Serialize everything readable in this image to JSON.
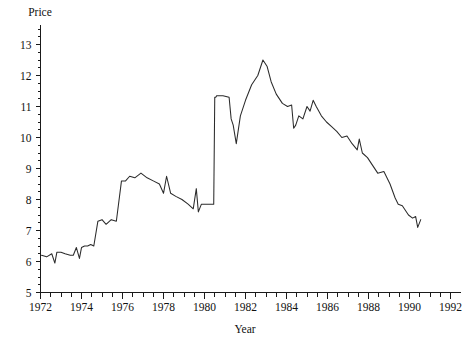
{
  "chart_data": {
    "type": "line",
    "title": "",
    "ylabel": "Price",
    "xlabel": "Year",
    "xlim": [
      1972,
      1992
    ],
    "ylim": [
      5,
      13
    ],
    "grid": false,
    "legend": "none",
    "x_tick_labels": [
      "1972",
      "1974",
      "1976",
      "1978",
      "1980",
      "1982",
      "1984",
      "1986",
      "1988",
      "1990",
      "1992"
    ],
    "x_tick_values": [
      1972,
      1974,
      1976,
      1978,
      1980,
      1982,
      1984,
      1986,
      1988,
      1990,
      1992
    ],
    "x_minor_step": 0.5,
    "y_tick_labels": [
      "5",
      "6",
      "7",
      "8",
      "9",
      "10",
      "11",
      "12",
      "13"
    ],
    "y_tick_values": [
      5,
      6,
      7,
      8,
      9,
      10,
      11,
      12,
      13
    ],
    "y_minor_step": 0.25,
    "line_color": "#2b2b2b",
    "axis_color": "#1a1a1a",
    "series": [
      {
        "name": "Price",
        "x": [
          1972.05,
          1972.3,
          1972.55,
          1972.7,
          1972.8,
          1973.0,
          1973.2,
          1973.45,
          1973.6,
          1973.75,
          1973.9,
          1974.0,
          1974.15,
          1974.3,
          1974.45,
          1974.6,
          1974.8,
          1975.0,
          1975.2,
          1975.45,
          1975.7,
          1975.95,
          1976.15,
          1976.35,
          1976.6,
          1976.9,
          1977.2,
          1977.5,
          1977.8,
          1978.0,
          1978.15,
          1978.35,
          1978.6,
          1978.9,
          1979.2,
          1979.45,
          1979.6,
          1979.7,
          1979.85,
          1980.0,
          1980.2,
          1980.45,
          1980.5,
          1980.55,
          1980.6,
          1980.9,
          1981.2,
          1981.3,
          1981.4,
          1981.55,
          1981.75,
          1982.0,
          1982.3,
          1982.6,
          1982.85,
          1983.05,
          1983.25,
          1983.5,
          1983.8,
          1984.05,
          1984.25,
          1984.35,
          1984.45,
          1984.6,
          1984.8,
          1985.0,
          1985.15,
          1985.3,
          1985.45,
          1985.7,
          1985.95,
          1986.2,
          1986.45,
          1986.7,
          1986.95,
          1987.2,
          1987.45,
          1987.55,
          1987.7,
          1987.95,
          1988.2,
          1988.45,
          1988.75,
          1989.05,
          1989.3,
          1989.45,
          1989.65,
          1989.95,
          1990.15,
          1990.3,
          1990.4,
          1990.55
        ],
        "y": [
          6.2,
          6.15,
          6.25,
          5.95,
          6.3,
          6.3,
          6.25,
          6.2,
          6.2,
          6.45,
          6.1,
          6.45,
          6.5,
          6.5,
          6.55,
          6.5,
          7.3,
          7.35,
          7.2,
          7.35,
          7.3,
          8.6,
          8.6,
          8.75,
          8.7,
          8.85,
          8.7,
          8.6,
          8.5,
          8.2,
          8.75,
          8.2,
          8.1,
          8.0,
          7.85,
          7.7,
          8.35,
          7.6,
          7.85,
          7.85,
          7.85,
          7.85,
          11.3,
          11.3,
          11.35,
          11.35,
          11.3,
          10.6,
          10.4,
          9.8,
          10.7,
          11.2,
          11.7,
          12.0,
          12.5,
          12.3,
          11.8,
          11.4,
          11.1,
          11.0,
          11.05,
          10.3,
          10.4,
          10.7,
          10.6,
          11.0,
          10.85,
          11.2,
          11.0,
          10.7,
          10.5,
          10.35,
          10.2,
          10.0,
          10.05,
          9.8,
          9.6,
          9.95,
          9.5,
          9.35,
          9.1,
          8.85,
          8.9,
          8.5,
          8.05,
          7.85,
          7.8,
          7.5,
          7.4,
          7.45,
          7.1,
          7.35
        ]
      }
    ]
  }
}
